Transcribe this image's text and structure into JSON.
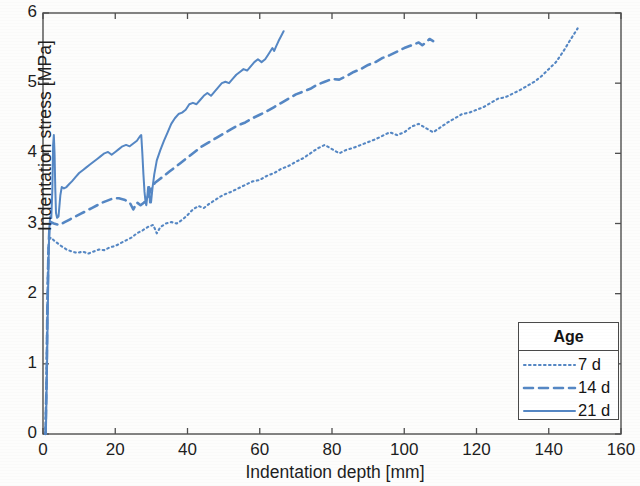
{
  "chart_data": {
    "type": "line",
    "title": "",
    "subtitle": "",
    "xlabel": "Indentation depth [mm]",
    "ylabel": "Indentation stress [MPa]",
    "xlim": [
      0,
      160
    ],
    "ylim": [
      0,
      6
    ],
    "xticks": [
      0,
      20,
      40,
      60,
      80,
      100,
      120,
      140,
      160
    ],
    "yticks": [
      0,
      1,
      2,
      3,
      4,
      5,
      6
    ],
    "grid": false,
    "legend": {
      "title": "Age",
      "position": "bottom-right",
      "entries": [
        {
          "label": "7 d",
          "style": "dotted"
        },
        {
          "label": "14 d",
          "style": "dashed"
        },
        {
          "label": "21 d",
          "style": "solid"
        }
      ]
    },
    "line_color": "#5587c4",
    "series": [
      {
        "name": "7 d",
        "style": "dotted",
        "points": [
          [
            0.6,
            0
          ],
          [
            0.9,
            0.6
          ],
          [
            1.1,
            1.4
          ],
          [
            1.3,
            2.2
          ],
          [
            1.5,
            2.65
          ],
          [
            1.8,
            2.78
          ],
          [
            2.2,
            2.8
          ],
          [
            3,
            2.76
          ],
          [
            4,
            2.72
          ],
          [
            5,
            2.68
          ],
          [
            6.5,
            2.63
          ],
          [
            8,
            2.6
          ],
          [
            9.5,
            2.58
          ],
          [
            11,
            2.6
          ],
          [
            12.5,
            2.57
          ],
          [
            14,
            2.6
          ],
          [
            15.5,
            2.63
          ],
          [
            17,
            2.62
          ],
          [
            18.5,
            2.66
          ],
          [
            20,
            2.68
          ],
          [
            21.5,
            2.72
          ],
          [
            23,
            2.76
          ],
          [
            24.5,
            2.8
          ],
          [
            26,
            2.86
          ],
          [
            27.5,
            2.9
          ],
          [
            29,
            2.95
          ],
          [
            30.5,
            2.98
          ],
          [
            31.5,
            2.86
          ],
          [
            32.5,
            2.95
          ],
          [
            34,
            3.0
          ],
          [
            35.5,
            3.02
          ],
          [
            37,
            3.0
          ],
          [
            38.5,
            3.05
          ],
          [
            40,
            3.12
          ],
          [
            41.5,
            3.2
          ],
          [
            43,
            3.25
          ],
          [
            44.5,
            3.22
          ],
          [
            46,
            3.28
          ],
          [
            47.5,
            3.33
          ],
          [
            49,
            3.38
          ],
          [
            50.5,
            3.42
          ],
          [
            52,
            3.45
          ],
          [
            54,
            3.5
          ],
          [
            56,
            3.55
          ],
          [
            58,
            3.6
          ],
          [
            60,
            3.62
          ],
          [
            62,
            3.68
          ],
          [
            64,
            3.72
          ],
          [
            66,
            3.78
          ],
          [
            68,
            3.82
          ],
          [
            70,
            3.88
          ],
          [
            72,
            3.93
          ],
          [
            74,
            4.0
          ],
          [
            76,
            4.07
          ],
          [
            78,
            4.12
          ],
          [
            80,
            4.06
          ],
          [
            82,
            4.0
          ],
          [
            84,
            4.05
          ],
          [
            86,
            4.08
          ],
          [
            88,
            4.12
          ],
          [
            90,
            4.16
          ],
          [
            92,
            4.2
          ],
          [
            94,
            4.25
          ],
          [
            96,
            4.3
          ],
          [
            98,
            4.26
          ],
          [
            100,
            4.3
          ],
          [
            102,
            4.38
          ],
          [
            104,
            4.42
          ],
          [
            106,
            4.36
          ],
          [
            108,
            4.3
          ],
          [
            110,
            4.37
          ],
          [
            112,
            4.44
          ],
          [
            114,
            4.5
          ],
          [
            116,
            4.56
          ],
          [
            118,
            4.58
          ],
          [
            120,
            4.62
          ],
          [
            122,
            4.66
          ],
          [
            124,
            4.72
          ],
          [
            126,
            4.78
          ],
          [
            128,
            4.8
          ],
          [
            130,
            4.85
          ],
          [
            132,
            4.9
          ],
          [
            134,
            4.96
          ],
          [
            136,
            5.02
          ],
          [
            138,
            5.1
          ],
          [
            140,
            5.2
          ],
          [
            142,
            5.3
          ],
          [
            144,
            5.45
          ],
          [
            146,
            5.62
          ],
          [
            148,
            5.78
          ]
        ]
      },
      {
        "name": "14 d",
        "style": "dashed",
        "points": [
          [
            0.7,
            0
          ],
          [
            1.0,
            0.8
          ],
          [
            1.2,
            1.8
          ],
          [
            1.5,
            2.6
          ],
          [
            1.8,
            2.95
          ],
          [
            2.2,
            3.02
          ],
          [
            3,
            3.0
          ],
          [
            4.5,
            2.98
          ],
          [
            6,
            3.02
          ],
          [
            7.5,
            3.06
          ],
          [
            9,
            3.1
          ],
          [
            10.5,
            3.14
          ],
          [
            12,
            3.18
          ],
          [
            13.5,
            3.22
          ],
          [
            15,
            3.26
          ],
          [
            16.5,
            3.3
          ],
          [
            18,
            3.33
          ],
          [
            19.5,
            3.36
          ],
          [
            21,
            3.36
          ],
          [
            22.5,
            3.34
          ],
          [
            24,
            3.3
          ],
          [
            25,
            3.2
          ],
          [
            26,
            3.3
          ],
          [
            27,
            3.26
          ],
          [
            28,
            3.3
          ],
          [
            29,
            3.38
          ],
          [
            30,
            3.5
          ],
          [
            31,
            3.58
          ],
          [
            32,
            3.62
          ],
          [
            33.5,
            3.68
          ],
          [
            35,
            3.74
          ],
          [
            36.5,
            3.8
          ],
          [
            38,
            3.86
          ],
          [
            39.5,
            3.92
          ],
          [
            41,
            3.98
          ],
          [
            42.5,
            4.04
          ],
          [
            44,
            4.1
          ],
          [
            46,
            4.16
          ],
          [
            48,
            4.22
          ],
          [
            50,
            4.28
          ],
          [
            52,
            4.34
          ],
          [
            54,
            4.4
          ],
          [
            56,
            4.44
          ],
          [
            58,
            4.5
          ],
          [
            60,
            4.55
          ],
          [
            62,
            4.6
          ],
          [
            64,
            4.66
          ],
          [
            66,
            4.72
          ],
          [
            68,
            4.78
          ],
          [
            70,
            4.84
          ],
          [
            72,
            4.88
          ],
          [
            74,
            4.92
          ],
          [
            76,
            4.98
          ],
          [
            78,
            5.02
          ],
          [
            80,
            5.06
          ],
          [
            82,
            5.05
          ],
          [
            84,
            5.1
          ],
          [
            86,
            5.16
          ],
          [
            88,
            5.2
          ],
          [
            90,
            5.26
          ],
          [
            92,
            5.3
          ],
          [
            94,
            5.36
          ],
          [
            96,
            5.4
          ],
          [
            98,
            5.45
          ],
          [
            100,
            5.5
          ],
          [
            102,
            5.54
          ],
          [
            104,
            5.58
          ],
          [
            105,
            5.54
          ],
          [
            106,
            5.58
          ],
          [
            107,
            5.63
          ],
          [
            108,
            5.6
          ]
        ]
      },
      {
        "name": "21 d",
        "style": "solid",
        "points": [
          [
            0.8,
            0
          ],
          [
            1.1,
            0.9
          ],
          [
            1.4,
            2.0
          ],
          [
            1.7,
            2.9
          ],
          [
            2.0,
            3.1
          ],
          [
            2.3,
            3.08
          ],
          [
            2.6,
            3.5
          ],
          [
            2.8,
            4.12
          ],
          [
            3.0,
            4.26
          ],
          [
            3.2,
            4.0
          ],
          [
            3.4,
            3.5
          ],
          [
            3.6,
            3.15
          ],
          [
            3.9,
            3.08
          ],
          [
            4.3,
            3.1
          ],
          [
            4.8,
            3.4
          ],
          [
            5.2,
            3.52
          ],
          [
            5.8,
            3.5
          ],
          [
            6.5,
            3.52
          ],
          [
            7.2,
            3.56
          ],
          [
            8,
            3.6
          ],
          [
            9,
            3.66
          ],
          [
            10,
            3.72
          ],
          [
            11,
            3.76
          ],
          [
            12,
            3.8
          ],
          [
            13,
            3.84
          ],
          [
            14,
            3.88
          ],
          [
            15,
            3.92
          ],
          [
            16,
            3.96
          ],
          [
            17,
            4.0
          ],
          [
            18,
            4.02
          ],
          [
            19,
            3.98
          ],
          [
            20,
            4.02
          ],
          [
            21,
            4.06
          ],
          [
            22,
            4.1
          ],
          [
            23,
            4.12
          ],
          [
            24,
            4.1
          ],
          [
            25,
            4.14
          ],
          [
            26,
            4.18
          ],
          [
            26.8,
            4.24
          ],
          [
            27.2,
            4.26
          ],
          [
            27.5,
            4.0
          ],
          [
            27.8,
            3.7
          ],
          [
            28.1,
            3.45
          ],
          [
            28.4,
            3.3
          ],
          [
            28.6,
            3.26
          ],
          [
            28.9,
            3.4
          ],
          [
            29.1,
            3.52
          ],
          [
            29.4,
            3.52
          ],
          [
            29.6,
            3.3
          ],
          [
            29.9,
            3.3
          ],
          [
            30.3,
            3.5
          ],
          [
            30.8,
            3.7
          ],
          [
            31.5,
            3.9
          ],
          [
            32.5,
            4.05
          ],
          [
            33.5,
            4.18
          ],
          [
            34.5,
            4.3
          ],
          [
            35.5,
            4.42
          ],
          [
            36.5,
            4.5
          ],
          [
            37.5,
            4.56
          ],
          [
            38.5,
            4.58
          ],
          [
            39.5,
            4.62
          ],
          [
            40.5,
            4.7
          ],
          [
            41.5,
            4.72
          ],
          [
            42.5,
            4.7
          ],
          [
            43.5,
            4.76
          ],
          [
            44.5,
            4.82
          ],
          [
            45.5,
            4.86
          ],
          [
            46.5,
            4.82
          ],
          [
            47.5,
            4.88
          ],
          [
            48.5,
            4.94
          ],
          [
            49.5,
            5.0
          ],
          [
            50.5,
            5.02
          ],
          [
            51.5,
            5.0
          ],
          [
            52.5,
            5.06
          ],
          [
            53.5,
            5.12
          ],
          [
            54.5,
            5.16
          ],
          [
            55.5,
            5.2
          ],
          [
            56.5,
            5.18
          ],
          [
            57.5,
            5.24
          ],
          [
            58.5,
            5.3
          ],
          [
            59.5,
            5.34
          ],
          [
            60.5,
            5.3
          ],
          [
            61.5,
            5.34
          ],
          [
            62.5,
            5.42
          ],
          [
            63.5,
            5.5
          ],
          [
            64,
            5.46
          ],
          [
            64.5,
            5.52
          ],
          [
            65.2,
            5.6
          ],
          [
            66,
            5.68
          ],
          [
            66.6,
            5.74
          ]
        ]
      }
    ]
  }
}
